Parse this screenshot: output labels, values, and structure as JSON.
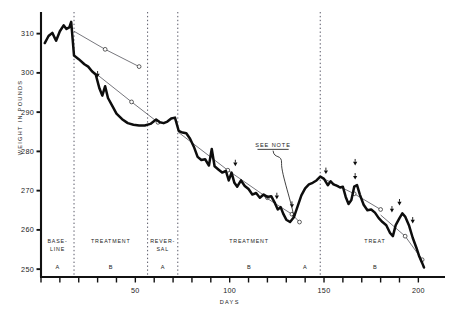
{
  "chart_data": {
    "type": "line",
    "title": "",
    "xlabel": "DAYS",
    "ylabel": "WEIGHT IN POUNDS",
    "xlim": [
      0,
      212
    ],
    "ylim": [
      248,
      315
    ],
    "xticks": [
      0,
      10,
      20,
      30,
      40,
      50,
      60,
      70,
      80,
      90,
      100,
      110,
      120,
      130,
      140,
      150,
      160,
      170,
      180,
      190,
      200
    ],
    "xtick_labels": [
      "",
      "",
      "",
      "",
      "",
      "50",
      "",
      "",
      "",
      "",
      "100",
      "",
      "",
      "",
      "",
      "150",
      "",
      "",
      "",
      "",
      "200"
    ],
    "yticks": [
      250,
      260,
      270,
      280,
      290,
      300,
      310
    ],
    "ytick_labels": [
      "250",
      "260",
      "270",
      "280",
      "290",
      "300",
      "310"
    ],
    "grid": false,
    "legend": "none",
    "series": [
      {
        "name": "daily weight",
        "style": "thick-black-line",
        "points": [
          [
            2,
            307.6
          ],
          [
            4,
            309.4
          ],
          [
            6,
            310.2
          ],
          [
            8,
            308.2
          ],
          [
            10,
            310.6
          ],
          [
            12,
            312.1
          ],
          [
            13.5,
            311.2
          ],
          [
            15,
            311.6
          ],
          [
            16,
            313.0
          ],
          [
            17.5,
            304.4
          ],
          [
            20,
            303.5
          ],
          [
            23,
            302.2
          ],
          [
            25,
            301.6
          ],
          [
            27,
            300.4
          ],
          [
            29,
            299.6
          ],
          [
            31,
            296.0
          ],
          [
            32.5,
            294.2
          ],
          [
            34,
            296.6
          ],
          [
            35.5,
            293.6
          ],
          [
            38,
            291.4
          ],
          [
            40,
            289.6
          ],
          [
            43,
            288.2
          ],
          [
            46,
            287.2
          ],
          [
            49,
            286.8
          ],
          [
            52,
            286.6
          ],
          [
            55,
            286.6
          ],
          [
            58,
            287.0
          ],
          [
            61,
            288.1
          ],
          [
            63,
            287.4
          ],
          [
            65,
            287.2
          ],
          [
            67,
            287.6
          ],
          [
            69,
            288.4
          ],
          [
            71,
            288.6
          ],
          [
            73,
            285.2
          ],
          [
            75,
            284.8
          ],
          [
            77,
            284.6
          ],
          [
            79,
            283.2
          ],
          [
            81,
            281.2
          ],
          [
            83,
            278.6
          ],
          [
            85,
            277.8
          ],
          [
            87,
            278.0
          ],
          [
            89,
            276.4
          ],
          [
            90.5,
            280.6
          ],
          [
            92,
            276.2
          ],
          [
            94,
            275.4
          ],
          [
            96,
            274.6
          ],
          [
            98,
            275.0
          ],
          [
            99.5,
            272.6
          ],
          [
            101,
            274.6
          ],
          [
            102.5,
            272.0
          ],
          [
            104,
            271.0
          ],
          [
            106,
            272.6
          ],
          [
            108,
            271.2
          ],
          [
            110,
            270.4
          ],
          [
            112,
            269.0
          ],
          [
            114,
            269.4
          ],
          [
            116,
            268.2
          ],
          [
            118,
            269.0
          ],
          [
            120,
            268.4
          ],
          [
            122,
            268.6
          ],
          [
            124,
            266.8
          ],
          [
            125.5,
            265.2
          ],
          [
            127,
            265.8
          ],
          [
            128.5,
            264.0
          ],
          [
            130,
            262.6
          ],
          [
            132,
            262.0
          ],
          [
            134,
            263.2
          ],
          [
            136,
            266.0
          ],
          [
            138,
            268.8
          ],
          [
            140,
            270.6
          ],
          [
            142,
            271.6
          ],
          [
            144,
            272.0
          ],
          [
            146,
            272.6
          ],
          [
            148,
            273.6
          ],
          [
            150,
            273.0
          ],
          [
            152,
            271.4
          ],
          [
            153.5,
            272.4
          ],
          [
            155,
            271.6
          ],
          [
            157,
            271.2
          ],
          [
            158.5,
            270.8
          ],
          [
            160,
            271.0
          ],
          [
            161.5,
            268.4
          ],
          [
            163,
            266.6
          ],
          [
            164.5,
            267.6
          ],
          [
            166,
            271.0
          ],
          [
            167.5,
            271.4
          ],
          [
            169,
            269.0
          ],
          [
            171,
            266.4
          ],
          [
            173,
            265.0
          ],
          [
            175,
            265.2
          ],
          [
            177,
            264.4
          ],
          [
            179,
            263.0
          ],
          [
            181,
            262.0
          ],
          [
            183,
            261.2
          ],
          [
            185,
            259.2
          ],
          [
            186.5,
            258.4
          ],
          [
            188,
            261.2
          ],
          [
            190,
            263.0
          ],
          [
            191.5,
            264.2
          ],
          [
            193,
            263.4
          ],
          [
            195,
            261.2
          ],
          [
            197,
            258.0
          ],
          [
            199,
            255.4
          ],
          [
            200.5,
            253.2
          ],
          [
            202,
            251.6
          ],
          [
            203,
            250.4
          ]
        ]
      },
      {
        "name": "trend line 1",
        "style": "thin-line-open-markers",
        "points": [
          [
            17.5,
            310.6
          ],
          [
            34,
            306.0
          ],
          [
            52,
            301.6
          ]
        ]
      },
      {
        "name": "trend line 2",
        "style": "thin-line-open-markers",
        "points": [
          [
            26,
            301.0
          ],
          [
            48,
            292.6
          ],
          [
            62,
            287.4
          ]
        ]
      },
      {
        "name": "trend line 3",
        "style": "thin-line-open-markers",
        "points": [
          [
            73,
            284.8
          ],
          [
            99,
            275.2
          ],
          [
            120,
            268.2
          ]
        ]
      },
      {
        "name": "trend line 4",
        "style": "thin-line-open-markers",
        "points": [
          [
            118,
            268.6
          ],
          [
            133,
            264.0
          ],
          [
            137,
            262.0
          ]
        ]
      },
      {
        "name": "trend line 5",
        "style": "thin-line-open-markers",
        "points": [
          [
            150,
            273.0
          ],
          [
            166,
            269.2
          ],
          [
            180,
            265.2
          ]
        ]
      },
      {
        "name": "trend line 6",
        "style": "thin-line-open-markers",
        "points": [
          [
            180,
            263.8
          ],
          [
            193,
            258.4
          ],
          [
            202,
            252.4
          ]
        ]
      }
    ],
    "event_markers": {
      "style": "small-down-arrow",
      "points": [
        [
          30,
          299.4
        ],
        [
          103,
          276.8
        ],
        [
          125,
          268.4
        ],
        [
          133,
          266.2
        ],
        [
          151,
          274.8
        ],
        [
          166.5,
          277.0
        ],
        [
          166.5,
          273.4
        ],
        [
          186,
          265.0
        ],
        [
          190,
          266.8
        ],
        [
          197,
          262.2
        ]
      ]
    },
    "annotations": [
      {
        "text": "SEE NOTE",
        "x": 123,
        "y": 281.0,
        "underline": true,
        "leader_to": [
          134,
          262.6
        ]
      }
    ],
    "phases": [
      {
        "name_lines": [
          "BASE-",
          "LINE"
        ],
        "letter": "A",
        "x_start": 0,
        "x_end": 17.5
      },
      {
        "name_lines": [
          "TREATMENT"
        ],
        "letter": "B",
        "x_start": 17.5,
        "x_end": 56.5
      },
      {
        "name_lines": [
          "REVER-",
          "SAL"
        ],
        "letter": "A",
        "x_start": 56.5,
        "x_end": 72.5
      },
      {
        "name_lines": [
          "TREATMENT"
        ],
        "letter": "B",
        "x_start": 72.5,
        "x_end": 148
      },
      {
        "name_lines": [
          "TREAT"
        ],
        "letter": "B",
        "x_start": 148,
        "x_end": 206
      }
    ],
    "phase_dividers": [
      17.5,
      56.5,
      72.5,
      148
    ],
    "extra_phase_letters": [
      {
        "letter": "A",
        "x": 140
      }
    ]
  }
}
